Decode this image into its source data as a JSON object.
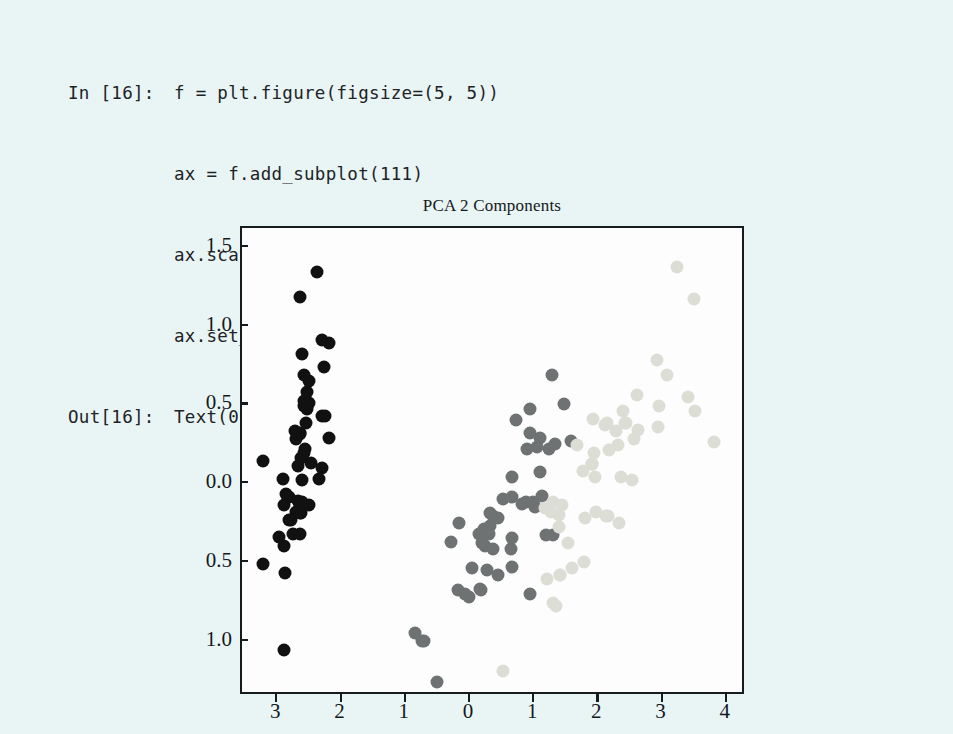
{
  "notebook": {
    "in_prompt": "In [16]:",
    "out_prompt": "Out[16]:",
    "code_lines": [
      "f = plt.figure(figsize=(5, 5))",
      "ax = f.add_subplot(111)",
      "ax.scatter(X_pca[:,0], X_pca[:, 1], c=iris.target)",
      "ax.set_title(\"PCA 2 Components\")"
    ],
    "output_line": "Text(0.5, 1.0, 'PCA 2 Components')"
  },
  "chart_data": {
    "type": "scatter",
    "title": "PCA 2 Components",
    "xlabel": "",
    "ylabel": "",
    "xlim": [
      -3.55,
      4.3
    ],
    "ylim": [
      -1.35,
      1.62
    ],
    "grid": false,
    "legend": false,
    "xticks": [
      -3,
      -2,
      -1,
      0,
      1,
      2,
      3,
      4
    ],
    "xtick_labels": [
      "3",
      "2",
      "1",
      "0",
      "1",
      "2",
      "3",
      "4"
    ],
    "yticks": [
      1.5,
      1.0,
      0.5,
      0.0,
      -0.5,
      -1.0
    ],
    "ytick_labels": [
      "1.5",
      "1.0",
      "0.5",
      "0.0",
      "0.5",
      "1.0"
    ],
    "marker_size": 13,
    "series": [
      {
        "name": "iris.target = 0",
        "color": "#111111",
        "points": [
          [
            -2.68,
            0.32
          ],
          [
            -2.71,
            -0.18
          ],
          [
            -2.89,
            -0.14
          ],
          [
            -2.75,
            -0.32
          ],
          [
            -2.73,
            0.33
          ],
          [
            -2.28,
            0.74
          ],
          [
            -2.82,
            -0.09
          ],
          [
            -2.63,
            0.16
          ],
          [
            -2.88,
            -0.57
          ],
          [
            -2.67,
            -0.11
          ],
          [
            -2.5,
            0.65
          ],
          [
            -2.61,
            0.02
          ],
          [
            -2.78,
            -0.23
          ],
          [
            -3.22,
            -0.51
          ],
          [
            -2.64,
            1.18
          ],
          [
            -2.38,
            1.34
          ],
          [
            -2.62,
            0.82
          ],
          [
            -2.65,
            0.32
          ],
          [
            -2.2,
            0.89
          ],
          [
            -2.59,
            0.52
          ],
          [
            -2.31,
            0.43
          ],
          [
            -2.54,
            0.47
          ],
          [
            -3.22,
            0.14
          ],
          [
            -2.3,
            0.1
          ],
          [
            -2.35,
            0.03
          ],
          [
            -2.51,
            -0.14
          ],
          [
            -2.47,
            0.13
          ],
          [
            -2.56,
            0.38
          ],
          [
            -2.64,
            0.31
          ],
          [
            -2.63,
            -0.19
          ],
          [
            -2.65,
            -0.32
          ],
          [
            -2.2,
            0.29
          ],
          [
            -2.59,
            0.69
          ],
          [
            -2.31,
            0.91
          ],
          [
            -2.62,
            -0.12
          ],
          [
            -2.87,
            -0.07
          ],
          [
            -2.54,
            0.58
          ],
          [
            -2.91,
            0.03
          ],
          [
            -2.9,
            -0.4
          ],
          [
            -2.57,
            0.22
          ],
          [
            -2.71,
            0.28
          ],
          [
            -2.89,
            -1.06
          ],
          [
            -2.98,
            -0.34
          ],
          [
            -2.59,
            0.19
          ],
          [
            -2.25,
            0.43
          ],
          [
            -2.65,
            -0.19
          ],
          [
            -2.51,
            0.51
          ],
          [
            -2.82,
            -0.23
          ],
          [
            -2.59,
            0.49
          ],
          [
            -2.67,
            0.11
          ]
        ]
      },
      {
        "name": "iris.target = 1",
        "color": "#6f7272",
        "points": [
          [
            1.28,
            0.69
          ],
          [
            0.93,
            0.32
          ],
          [
            1.46,
            0.5
          ],
          [
            0.18,
            -0.68
          ],
          [
            1.09,
            0.29
          ],
          [
            0.64,
            -0.42
          ],
          [
            1.09,
            0.07
          ],
          [
            -0.75,
            -1.0
          ],
          [
            1.04,
            0.23
          ],
          [
            -0.01,
            -0.72
          ],
          [
            -0.51,
            -1.26
          ],
          [
            0.51,
            -0.1
          ],
          [
            0.26,
            -0.55
          ],
          [
            0.98,
            -0.12
          ],
          [
            -0.17,
            -0.25
          ],
          [
            0.93,
            0.47
          ],
          [
            0.66,
            -0.35
          ],
          [
            0.23,
            -0.4
          ],
          [
            0.94,
            -0.7
          ],
          [
            0.04,
            -0.54
          ],
          [
            1.12,
            -0.08
          ],
          [
            0.36,
            -0.21
          ],
          [
            1.3,
            -0.33
          ],
          [
            1.02,
            -0.15
          ],
          [
            0.66,
            0.04
          ],
          [
            0.89,
            0.22
          ],
          [
            1.33,
            0.25
          ],
          [
            1.57,
            0.27
          ],
          [
            0.81,
            -0.13
          ],
          [
            -0.3,
            -0.37
          ],
          [
            -0.07,
            -0.7
          ],
          [
            -0.19,
            -0.68
          ],
          [
            0.14,
            -0.32
          ],
          [
            1.19,
            -0.33
          ],
          [
            0.44,
            -0.22
          ],
          [
            0.71,
            0.4
          ],
          [
            1.23,
            0.22
          ],
          [
            0.65,
            -0.53
          ],
          [
            0.22,
            -0.29
          ],
          [
            0.15,
            -0.67
          ],
          [
            0.43,
            -0.58
          ],
          [
            0.88,
            -0.12
          ],
          [
            0.19,
            -0.38
          ],
          [
            -0.72,
            -1.0
          ],
          [
            0.36,
            -0.42
          ],
          [
            0.31,
            -0.19
          ],
          [
            0.32,
            -0.27
          ],
          [
            0.65,
            -0.09
          ],
          [
            -0.86,
            -0.95
          ],
          [
            0.29,
            -0.32
          ]
        ]
      },
      {
        "name": "iris.target = 2",
        "color": "#dcded6",
        "points": [
          [
            2.53,
            0.02
          ],
          [
            1.41,
            -0.58
          ],
          [
            2.62,
            0.34
          ],
          [
            1.97,
            -0.18
          ],
          [
            2.35,
            0.04
          ],
          [
            3.4,
            0.55
          ],
          [
            0.52,
            -1.19
          ],
          [
            2.93,
            0.36
          ],
          [
            2.32,
            -0.25
          ],
          [
            2.92,
            0.78
          ],
          [
            1.66,
            0.24
          ],
          [
            1.8,
            -0.22
          ],
          [
            2.17,
            0.21
          ],
          [
            1.34,
            -0.78
          ],
          [
            1.59,
            -0.54
          ],
          [
            1.9,
            0.12
          ],
          [
            1.95,
            0.04
          ],
          [
            3.49,
            1.17
          ],
          [
            3.8,
            0.26
          ],
          [
            1.3,
            -0.76
          ],
          [
            2.43,
            0.38
          ],
          [
            1.2,
            -0.61
          ],
          [
            3.5,
            0.46
          ],
          [
            1.39,
            -0.2
          ],
          [
            2.28,
            0.33
          ],
          [
            2.61,
            0.56
          ],
          [
            1.26,
            -0.18
          ],
          [
            1.29,
            -0.12
          ],
          [
            2.12,
            -0.21
          ],
          [
            2.38,
            0.46
          ],
          [
            2.94,
            0.49
          ],
          [
            3.23,
            1.37
          ],
          [
            2.15,
            -0.21
          ],
          [
            1.44,
            -0.14
          ],
          [
            1.78,
            -0.5
          ],
          [
            3.07,
            0.69
          ],
          [
            2.14,
            0.38
          ],
          [
            1.9,
            0.12
          ],
          [
            1.17,
            -0.16
          ],
          [
            2.11,
            0.37
          ],
          [
            2.31,
            0.24
          ],
          [
            1.92,
            0.41
          ],
          [
            1.41,
            -0.58
          ],
          [
            2.56,
            0.28
          ],
          [
            2.42,
            0.38
          ],
          [
            1.94,
            0.19
          ],
          [
            1.53,
            -0.38
          ],
          [
            1.76,
            0.08
          ],
          [
            1.9,
            0.12
          ],
          [
            1.39,
            -0.28
          ]
        ]
      }
    ]
  }
}
